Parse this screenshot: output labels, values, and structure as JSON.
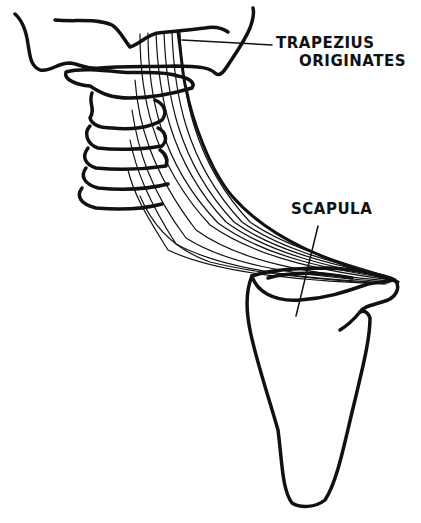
{
  "diagram": {
    "labels": {
      "trapezius_line1": "TRAPEZIUS",
      "trapezius_line2": "ORIGINATES",
      "scapula": "SCAPULA"
    },
    "colors": {
      "ink": "#111111",
      "background": "#ffffff"
    }
  }
}
